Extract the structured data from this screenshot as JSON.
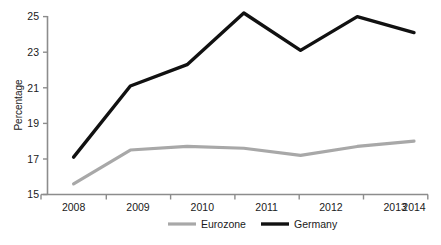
{
  "chart_data": {
    "type": "line",
    "title": "",
    "xlabel": "",
    "ylabel": "Percentage",
    "categories": [
      "2008",
      "2009",
      "2010",
      "2011",
      "2012",
      "2013",
      "2014"
    ],
    "x": [
      2008,
      2009,
      2010,
      2011,
      2012,
      2013,
      2014
    ],
    "series": [
      {
        "name": "Eurozone",
        "color": "#a8a8a8",
        "values": [
          15.6,
          17.5,
          17.7,
          17.6,
          17.2,
          17.7,
          18.0
        ]
      },
      {
        "name": "Germany",
        "color": "#111111",
        "values": [
          17.1,
          21.1,
          22.3,
          25.2,
          23.1,
          25.0,
          24.1
        ]
      }
    ],
    "ylim": [
      15,
      25
    ],
    "yticks": [
      15,
      17,
      19,
      21,
      23,
      25
    ],
    "ytick_labels": [
      "15",
      "17",
      "19",
      "21",
      "23",
      "25"
    ],
    "xtick_labels": [
      "2008",
      "2009",
      "2010",
      "2011",
      "2012",
      "2013",
      "2014"
    ],
    "grid": false,
    "legend_position": "bottom",
    "legend": [
      {
        "label": "Eurozone",
        "color": "#a8a8a8"
      },
      {
        "label": "Germany",
        "color": "#111111"
      }
    ]
  },
  "axes": {
    "y_axis_title": "Percentage"
  }
}
